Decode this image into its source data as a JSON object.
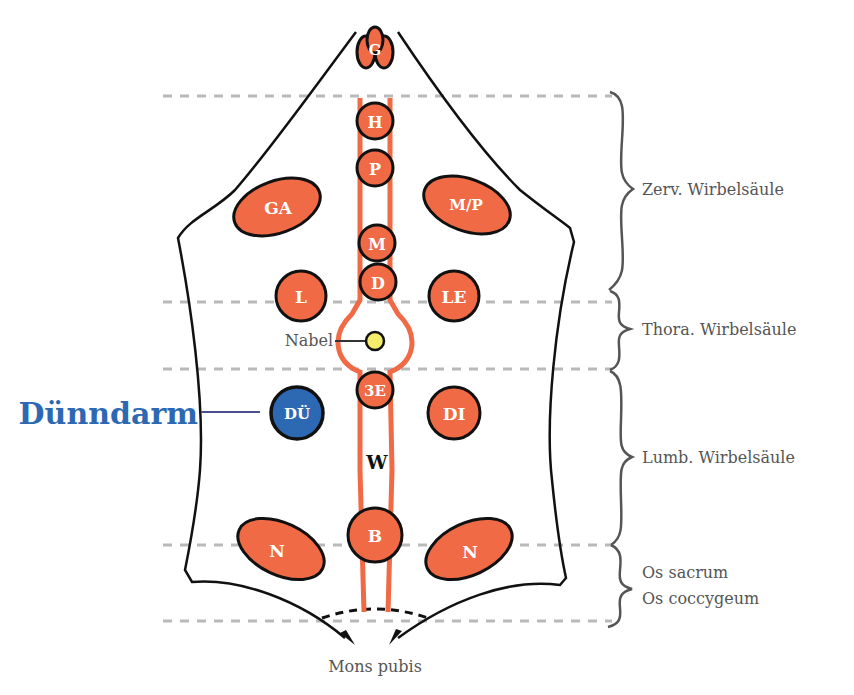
{
  "diagram": {
    "colors": {
      "organ": "#ef6a45",
      "organ_stroke": "#111111",
      "highlight": "#2d68b2",
      "navel": "#f4ec6a",
      "vessel": "#ef6a45",
      "guide_line": "#b9b9b9",
      "brace": "#555555",
      "label_text": "#555555"
    },
    "organs": [
      {
        "id": "G",
        "label": "G"
      },
      {
        "id": "H",
        "label": "H"
      },
      {
        "id": "P",
        "label": "P"
      },
      {
        "id": "GA",
        "label": "GA"
      },
      {
        "id": "MP",
        "label": "M/P"
      },
      {
        "id": "M",
        "label": "M"
      },
      {
        "id": "D",
        "label": "D"
      },
      {
        "id": "L",
        "label": "L"
      },
      {
        "id": "LE",
        "label": "LE"
      },
      {
        "id": "3E",
        "label": "3E"
      },
      {
        "id": "DU",
        "label": "DÜ"
      },
      {
        "id": "DI",
        "label": "DI"
      },
      {
        "id": "W",
        "label": "W"
      },
      {
        "id": "B",
        "label": "B"
      },
      {
        "id": "N_left",
        "label": "N"
      },
      {
        "id": "N_right",
        "label": "N"
      }
    ],
    "navel_label": "Nabel",
    "highlight_label": "Dünndarm",
    "bottom_label": "Mons pubis",
    "spine_sections": [
      {
        "label": "Zerv. Wirbelsäule"
      },
      {
        "label": "Thora. Wirbelsäule"
      },
      {
        "label": "Lumb. Wirbelsäule"
      },
      {
        "label_line1": "Os sacrum",
        "label_line2": "Os coccygeum"
      }
    ]
  }
}
